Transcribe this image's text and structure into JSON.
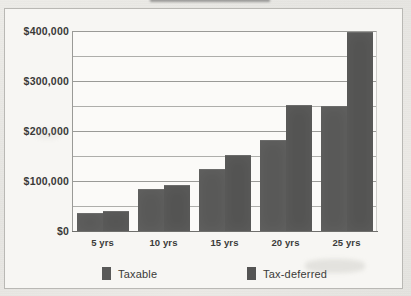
{
  "chart_data": {
    "type": "bar",
    "title": "",
    "xlabel": "",
    "ylabel": "",
    "categories": [
      "5 yrs",
      "10 yrs",
      "15 yrs",
      "20 yrs",
      "25 yrs"
    ],
    "series": [
      {
        "name": "Taxable",
        "color": "#595958",
        "values": [
          34000,
          82000,
          122000,
          181000,
          249000
        ]
      },
      {
        "name": "Tax-deferred",
        "color": "#545453",
        "values": [
          39000,
          91000,
          151000,
          251000,
          397000
        ]
      }
    ],
    "ylim": [
      0,
      400000
    ],
    "ytick_values": [
      0,
      100000,
      200000,
      300000,
      400000
    ],
    "ytick_labels": [
      "$0",
      "$100,000",
      "$200,000",
      "$300,000",
      "$400,000"
    ],
    "gridline_values": [
      0,
      50000,
      100000,
      150000,
      200000,
      250000,
      300000,
      350000,
      400000
    ],
    "gridline_major": [
      100000,
      200000,
      300000,
      400000
    ],
    "grid": true,
    "legend_position": "bottom"
  }
}
